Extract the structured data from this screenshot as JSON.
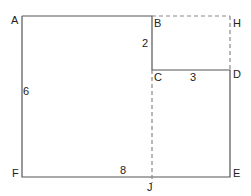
{
  "diagram": {
    "points": {
      "A": "A",
      "B": "B",
      "C": "C",
      "D": "D",
      "E": "E",
      "F": "F",
      "H": "H",
      "J": "J"
    },
    "lengths": {
      "AF": "6",
      "BC": "2",
      "CD": "3",
      "FJ": "8"
    },
    "colors": {
      "line": "#555555",
      "dashed": "#888888"
    }
  }
}
